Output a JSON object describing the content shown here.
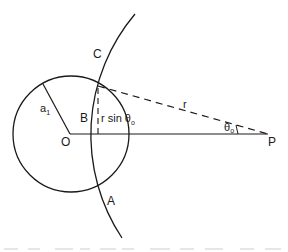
{
  "figure": {
    "type": "geometry-diagram",
    "colors": {
      "stroke": "#1a1a1a",
      "background": "#ffffff"
    },
    "labels": {
      "C": "C",
      "A": "A",
      "B": "B",
      "O": "O",
      "P": "P",
      "a1_base": "a",
      "a1_sub": "1",
      "r": "r",
      "rsin": "r sin",
      "theta_base": "θ",
      "theta_sub": "o",
      "theta_p_base": "θ",
      "theta_p_sub": "o"
    },
    "geometry": {
      "small_circle": {
        "cx": 71,
        "cy": 134,
        "r": 58
      },
      "line_OP": {
        "x1": 70,
        "y1": 134,
        "x2": 268,
        "y2": 134
      },
      "radius_a1": {
        "x1": 70,
        "y1": 134,
        "x2": 43,
        "y2": 84
      },
      "large_arc": {
        "center_x": 278,
        "center_y": 134,
        "r": 187,
        "from": [
          135,
          14
        ],
        "to": [
          122,
          238
        ]
      },
      "dashed_r": {
        "x1": 98,
        "y1": 86,
        "x2": 268,
        "y2": 134
      },
      "dashed_vertical": {
        "x1": 98,
        "y1": 86,
        "x2": 98,
        "y2": 134
      }
    }
  }
}
